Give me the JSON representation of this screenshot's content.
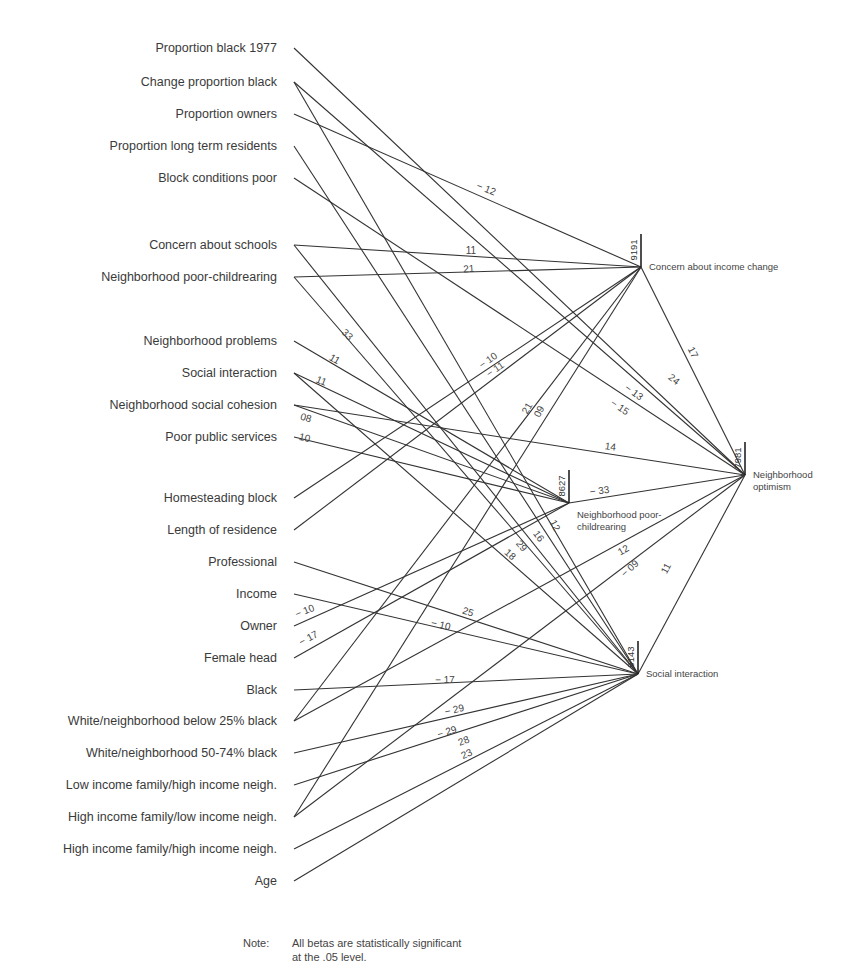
{
  "chart_data": {
    "type": "path-diagram",
    "title": "",
    "note_label": "Note:",
    "note_text_line1": "All betas are statistically significant",
    "note_text_line2": "at the .05 level.",
    "predictors": [
      {
        "id": "p1",
        "label": "Proportion black 1977",
        "y": 48
      },
      {
        "id": "p2",
        "label": "Change proportion black",
        "y": 82
      },
      {
        "id": "p3",
        "label": "Proportion owners",
        "y": 114
      },
      {
        "id": "p4",
        "label": "Proportion long term residents",
        "y": 146
      },
      {
        "id": "p5",
        "label": "Block conditions poor",
        "y": 178
      },
      {
        "id": "p6",
        "label": "Concern about schools",
        "y": 245
      },
      {
        "id": "p7",
        "label": "Neighborhood poor-childrearing",
        "y": 277
      },
      {
        "id": "p8",
        "label": "Neighborhood problems",
        "y": 341
      },
      {
        "id": "p9",
        "label": "Social interaction",
        "y": 373
      },
      {
        "id": "p10",
        "label": "Neighborhood social cohesion",
        "y": 405
      },
      {
        "id": "p11",
        "label": "Poor public services",
        "y": 437
      },
      {
        "id": "p12",
        "label": "Homesteading block",
        "y": 498
      },
      {
        "id": "p13",
        "label": "Length of residence",
        "y": 530
      },
      {
        "id": "p14",
        "label": "Professional",
        "y": 562
      },
      {
        "id": "p15",
        "label": "Income",
        "y": 594
      },
      {
        "id": "p16",
        "label": "Owner",
        "y": 626
      },
      {
        "id": "p17",
        "label": "Female head",
        "y": 658
      },
      {
        "id": "p18",
        "label": "Black",
        "y": 690
      },
      {
        "id": "p19",
        "label": "White/neighborhood below 25% black",
        "y": 721
      },
      {
        "id": "p20",
        "label": "White/neighborhood 50-74% black",
        "y": 753
      },
      {
        "id": "p21",
        "label": "Low income family/high income neigh.",
        "y": 785
      },
      {
        "id": "p22",
        "label": "High income family/low income neigh.",
        "y": 817
      },
      {
        "id": "p23",
        "label": "High income family/high income neigh.",
        "y": 849
      },
      {
        "id": "p24",
        "label": "Age",
        "y": 881
      }
    ],
    "outcomes": [
      {
        "id": "cic",
        "label_line1": "Concern about income change",
        "label_line2": "",
        "x": 641,
        "y": 267,
        "r2_label": "9191"
      },
      {
        "id": "npc",
        "label_line1": "Neighborhood poor-",
        "label_line2": "childrearing",
        "x": 569,
        "y": 503,
        "r2_label": "8627"
      },
      {
        "id": "si",
        "label_line1": "Social interaction",
        "label_line2": "",
        "x": 638,
        "y": 674,
        "r2_label": "9143"
      },
      {
        "id": "no",
        "label_line1": "Neighborhood",
        "label_line2": "optimism",
        "x": 745,
        "y": 475,
        "r2_label": "7981"
      }
    ],
    "paths": [
      {
        "from": "p1",
        "to": "no",
        "beta": "24",
        "lx": 672,
        "ly": 382,
        "rot": 38
      },
      {
        "from": "p2",
        "to": "no",
        "beta": "− 13",
        "lx": 632,
        "ly": 395,
        "rot": 36
      },
      {
        "from": "p2",
        "to": "si",
        "beta": "12",
        "lx": 552,
        "ly": 527,
        "rot": 62
      },
      {
        "from": "p3",
        "to": "cic",
        "beta": "− 12",
        "lx": 485,
        "ly": 192,
        "rot": 22
      },
      {
        "from": "p4",
        "to": "si",
        "beta": "29",
        "lx": 519,
        "ly": 548,
        "rot": 50
      },
      {
        "from": "p5",
        "to": "no",
        "beta": "− 15",
        "lx": 618,
        "ly": 410,
        "rot": 34
      },
      {
        "from": "p6",
        "to": "cic",
        "beta": "11",
        "lx": 471,
        "ly": 254,
        "rot": 0
      },
      {
        "from": "p6",
        "to": "si",
        "beta": "16",
        "lx": 536,
        "ly": 538,
        "rot": 55
      },
      {
        "from": "p7",
        "to": "cic",
        "beta": "21",
        "lx": 469,
        "ly": 272,
        "rot": -4
      },
      {
        "from": "p7",
        "to": "si",
        "beta": "33",
        "lx": 345,
        "ly": 337,
        "rot": 45
      },
      {
        "from": "p8",
        "to": "npc",
        "beta": "11",
        "lx": 333,
        "ly": 362,
        "rot": 30
      },
      {
        "from": "p9",
        "to": "npc",
        "beta": "11",
        "lx": 320,
        "ly": 384,
        "rot": 22
      },
      {
        "from": "p9",
        "to": "si",
        "beta": "18",
        "lx": 508,
        "ly": 557,
        "rot": 42
      },
      {
        "from": "p10",
        "to": "npc",
        "beta": "08",
        "lx": 305,
        "ly": 421,
        "rot": 15
      },
      {
        "from": "p10",
        "to": "no",
        "beta": "14",
        "lx": 610,
        "ly": 450,
        "rot": 7
      },
      {
        "from": "p11",
        "to": "npc",
        "beta": "10",
        "lx": 304,
        "ly": 441,
        "rot": 12
      },
      {
        "from": "p12",
        "to": "cic",
        "beta": "− 10",
        "lx": 490,
        "ly": 363,
        "rot": -35
      },
      {
        "from": "p13",
        "to": "cic",
        "beta": "− 11",
        "lx": 497,
        "ly": 372,
        "rot": -35
      },
      {
        "from": "npc",
        "to": "no",
        "beta": "− 33",
        "lx": 600,
        "ly": 494,
        "rot": -8
      },
      {
        "from": "cic",
        "to": "no",
        "beta": "17",
        "lx": 690,
        "ly": 354,
        "rot": 62
      },
      {
        "from": "si",
        "to": "no",
        "beta": "11",
        "lx": 669,
        "ly": 570,
        "rot": -62
      },
      {
        "from": "p14",
        "to": "si",
        "beta": "25",
        "lx": 467,
        "ly": 615,
        "rot": 18
      },
      {
        "from": "p15",
        "to": "si",
        "beta": "− 10",
        "lx": 440,
        "ly": 628,
        "rot": 13
      },
      {
        "from": "p16",
        "to": "npc",
        "beta": "− 10",
        "lx": 306,
        "ly": 614,
        "rot": -22
      },
      {
        "from": "p17",
        "to": "npc",
        "beta": "− 17",
        "lx": 310,
        "ly": 641,
        "rot": -28
      },
      {
        "from": "p18",
        "to": "si",
        "beta": "− 17",
        "lx": 445,
        "ly": 683,
        "rot": -1
      },
      {
        "from": "p19",
        "to": "cic",
        "beta": "21",
        "lx": 530,
        "ly": 410,
        "rot": -60
      },
      {
        "from": "p19",
        "to": "no",
        "beta": "12",
        "lx": 625,
        "ly": 553,
        "rot": -30
      },
      {
        "from": "p20",
        "to": "si",
        "beta": "− 29",
        "lx": 455,
        "ly": 713,
        "rot": -13
      },
      {
        "from": "p21",
        "to": "si",
        "beta": "− 29",
        "lx": 448,
        "ly": 735,
        "rot": -17
      },
      {
        "from": "p22",
        "to": "cic",
        "beta": "09",
        "lx": 542,
        "ly": 413,
        "rot": -62
      },
      {
        "from": "p22",
        "to": "no",
        "beta": "− 09",
        "lx": 632,
        "ly": 571,
        "rot": -42
      },
      {
        "from": "p23",
        "to": "si",
        "beta": "28",
        "lx": 465,
        "ly": 744,
        "rot": -22
      },
      {
        "from": "p24",
        "to": "si",
        "beta": "23",
        "lx": 468,
        "ly": 757,
        "rot": -25
      }
    ],
    "colors": {
      "line": "#333333",
      "text": "#3a3a3a",
      "background": "#ffffff"
    }
  }
}
